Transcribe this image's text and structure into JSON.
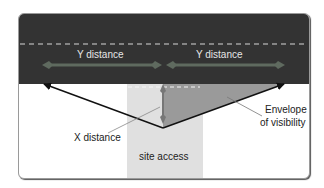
{
  "diagram": {
    "labels": {
      "y_distance_left": "Y distance",
      "y_distance_right": "Y distance",
      "x_distance": "X distance",
      "envelope_line1": "Envelope",
      "envelope_line2": "of visibility",
      "site_access": "site access"
    },
    "colors": {
      "road": "#333333",
      "access": "#e0e0e0",
      "envelope": "#9a9a9a",
      "y_arrow": "#5f6a5f",
      "x_arrow": "#7a7a7a",
      "sight_lines": "#111111",
      "dashed_centerline": "#d8d8d8"
    }
  }
}
